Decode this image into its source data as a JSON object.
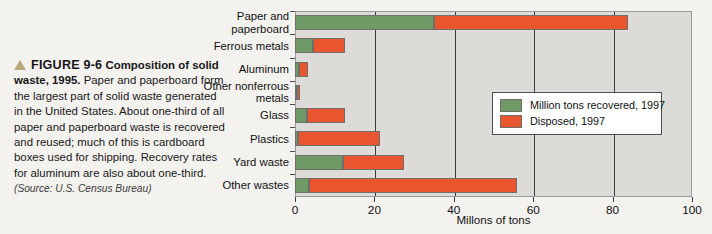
{
  "caption": {
    "marker_icon": "triangle-up-icon",
    "figure_number": "FIGURE 9-6",
    "figure_title": "Composition of solid waste, 1995.",
    "body": "Paper and paperboard form the largest part of solid waste generated in the United States. About one-third of all paper and paperboard waste is recovered and reused; much of this is cardboard boxes used for shipping. Recovery rates for aluminum are also about one-third.",
    "source": "(Source: U.S. Census Bureau)"
  },
  "legend": {
    "position": "inside-right",
    "items": [
      {
        "label": "Million tons recovered, 1997",
        "color": "#6f9a66"
      },
      {
        "label": "Disposed, 1997",
        "color": "#e8552f"
      }
    ]
  },
  "colors": {
    "recovered": "#6f9a66",
    "disposed": "#e8552f",
    "plot_background": "#dcdbd7",
    "page_background": "#f4f2ee",
    "gridline": "#3b3b3d",
    "caption_marker": "#b9a97b"
  },
  "chart_data": {
    "type": "bar",
    "orientation": "horizontal",
    "stacked": true,
    "title": "",
    "xlabel": "Millons of tons",
    "ylabel": "",
    "xlim": [
      0,
      100
    ],
    "xticks": [
      0,
      20,
      40,
      60,
      80,
      100
    ],
    "grid": true,
    "categories": [
      "Paper and paperboard",
      "Ferrous metals",
      "Aluminum",
      "Other nonferrous metals",
      "Glass",
      "Plastics",
      "Yard waste",
      "Other wastes"
    ],
    "series": [
      {
        "name": "Million tons recovered, 1997",
        "color": "#6f9a66",
        "values": [
          35.0,
          4.5,
          0.9,
          0.5,
          3.0,
          0.8,
          12.0,
          3.5
        ]
      },
      {
        "name": "Disposed, 1997",
        "color": "#e8552f",
        "values": [
          49.0,
          8.0,
          2.3,
          0.8,
          9.5,
          20.7,
          15.5,
          52.5
        ]
      }
    ],
    "totals": [
      84.0,
      12.5,
      3.2,
      1.3,
      12.5,
      21.5,
      27.5,
      56.0
    ]
  }
}
